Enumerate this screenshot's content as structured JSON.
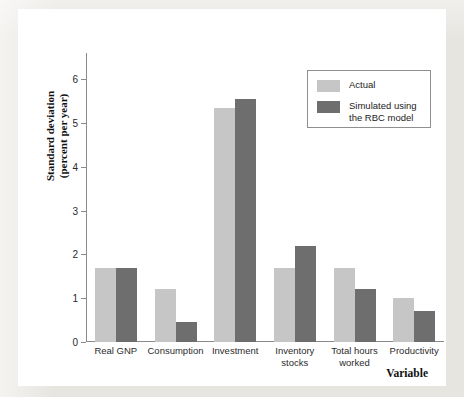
{
  "chart_data": {
    "type": "bar",
    "title": "",
    "xlabel": "Variable",
    "ylabel": "Standard deviation\n(percent per year)",
    "ylim": [
      0,
      6.6
    ],
    "yticks": [
      0,
      1,
      2,
      3,
      4,
      5,
      6
    ],
    "ytick_labels": [
      "0",
      "1",
      "2",
      "3",
      "4",
      "5",
      "6"
    ],
    "grid": false,
    "legend_position": "upper-right",
    "categories": [
      "Real GNP",
      "Consumption",
      "Investment",
      "Inventory\nstocks",
      "Total hours\nworked",
      "Productivity"
    ],
    "series": [
      {
        "name": "Actual",
        "color": "#c6c6c6",
        "values": [
          1.7,
          1.2,
          5.35,
          1.7,
          1.7,
          1.0
        ]
      },
      {
        "name": "Simulated using\nthe RBC model",
        "color": "#6e6e6e",
        "values": [
          1.7,
          0.45,
          5.55,
          2.2,
          1.22,
          0.7
        ]
      }
    ]
  },
  "legend": {
    "entries": [
      {
        "label": "Actual",
        "swatch": "actual"
      },
      {
        "label": "Simulated using\nthe RBC model",
        "swatch": "sim"
      }
    ]
  },
  "colors": {
    "actual": "#c6c6c6",
    "simulated": "#6e6e6e",
    "axis": "#8a8a8a",
    "card": "#ffffff",
    "page": "#e7e5e0"
  }
}
